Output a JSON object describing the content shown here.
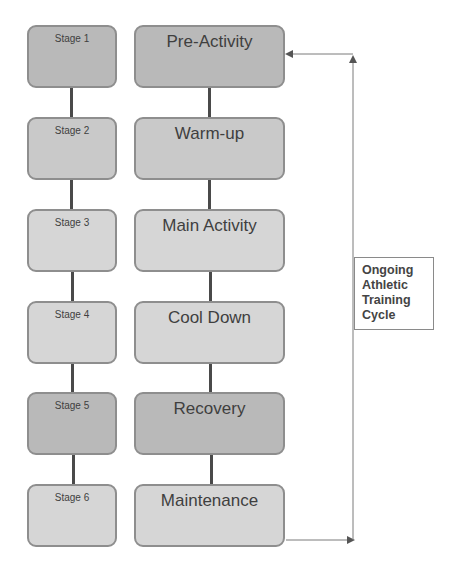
{
  "diagram": {
    "title": "Ongoing Athletic Training Cycle",
    "stages": [
      {
        "stage": "Stage 1",
        "phase": "Pre-Activity",
        "shade": "dark"
      },
      {
        "stage": "Stage 2",
        "phase": "Warm-up",
        "shade": "mid"
      },
      {
        "stage": "Stage 3",
        "phase": "Main Activity",
        "shade": "light"
      },
      {
        "stage": "Stage 4",
        "phase": "Cool Down",
        "shade": "light"
      },
      {
        "stage": "Stage 5",
        "phase": "Recovery",
        "shade": "dark"
      },
      {
        "stage": "Stage 6",
        "phase": "Maintenance",
        "shade": "light"
      }
    ],
    "cycle_label_lines": [
      "Ongoing",
      "Athletic",
      "Training",
      "Cycle"
    ],
    "colors": {
      "dark": "#b9b9b9",
      "mid": "#c9c9c9",
      "light": "#d6d6d6",
      "connector": "#4a4a4a",
      "arrow": "#555555"
    }
  }
}
